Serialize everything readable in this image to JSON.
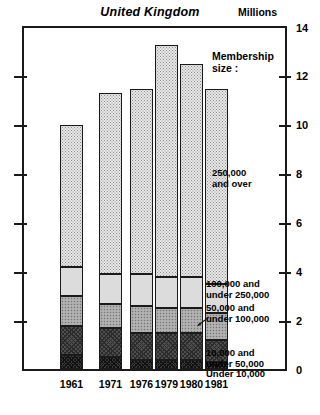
{
  "chart_title": "United Kingdom",
  "units_label": "Millions",
  "legend": {
    "heading": "Membership\nsize :",
    "items": [
      {
        "key": "over250",
        "label": "250,000\nand over"
      },
      {
        "key": "100to250",
        "label": "100,000 and\nunder 250,000"
      },
      {
        "key": "50to100",
        "label": "50,000 and\nunder 100,000"
      },
      {
        "key": "10to50",
        "label": "10,000 and\nunder 50,000"
      },
      {
        "key": "under10",
        "label": "Under 10,000"
      }
    ]
  },
  "chart_data": {
    "type": "bar",
    "subtype": "stacked-vertical",
    "title": "United Kingdom",
    "xlabel": "",
    "ylabel": "Millions",
    "ylim": [
      0,
      14
    ],
    "yticks": [
      0,
      2,
      4,
      6,
      8,
      10,
      12,
      14
    ],
    "ytick_labels": [
      "0",
      "2",
      "4",
      "6",
      "8",
      "10",
      "12",
      "14"
    ],
    "grid": false,
    "legend_position": "right",
    "legend_title": "Membership size :",
    "categories": [
      "1961",
      "1971",
      "1976",
      "1979",
      "1980",
      "1981"
    ],
    "series": [
      {
        "name": "Under 10,000",
        "values": [
          0.6,
          0.5,
          0.4,
          0.4,
          0.4,
          0.3
        ]
      },
      {
        "name": "10,000 and under 50,000",
        "values": [
          1.2,
          1.2,
          1.1,
          1.1,
          1.1,
          0.9
        ]
      },
      {
        "name": "50,000 and under 100,000",
        "values": [
          1.2,
          1.0,
          1.1,
          1.0,
          1.0,
          1.1
        ]
      },
      {
        "name": "100,000 and under 250,000",
        "values": [
          1.2,
          1.2,
          1.3,
          1.3,
          1.3,
          1.2
        ]
      },
      {
        "name": "250,000 and over",
        "values": [
          5.8,
          7.4,
          7.6,
          9.5,
          8.7,
          8.0
        ]
      }
    ],
    "totals": [
      10.0,
      11.3,
      11.5,
      13.3,
      12.5,
      11.5
    ]
  },
  "axis": {
    "right_ticks": [
      "14",
      "12",
      "10",
      "8",
      "6",
      "4",
      "2",
      "0"
    ]
  },
  "x_axis_labels": [
    "1961",
    "1971",
    "1976",
    "1979",
    "1980",
    "1981"
  ]
}
